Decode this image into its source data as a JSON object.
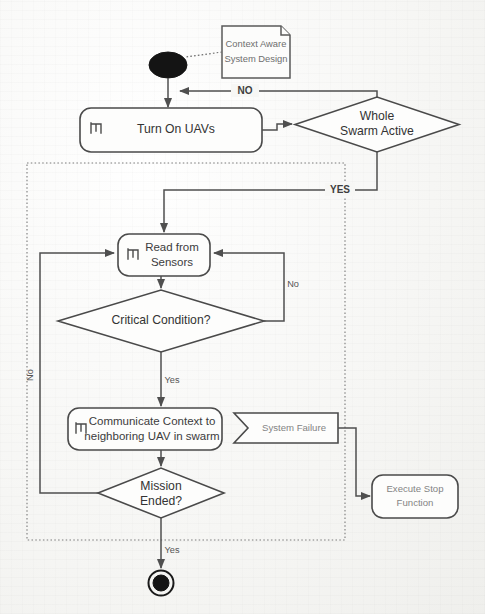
{
  "diagram": {
    "type": "uml-activity-diagram",
    "colors": {
      "stroke": "#4a4a4a",
      "fill": "#fdfdfc",
      "background": "#fbfbfa",
      "text": "#3c3c3c",
      "faint_text": "#848484"
    }
  },
  "note": {
    "line1": "Context Aware",
    "line2": "System Design"
  },
  "nodes": {
    "start": {
      "label": "",
      "shape": "initial-node"
    },
    "turn_on_uavs": {
      "label": "Turn On UAVs",
      "shape": "rounded-action",
      "icon": "rake-icon"
    },
    "whole_swarm_active": {
      "line1": "Whole",
      "line2": "Swarm Active",
      "shape": "decision-diamond"
    },
    "read_from_sensors": {
      "line1": "Read from",
      "line2": "Sensors",
      "shape": "rounded-action",
      "icon": "rake-icon"
    },
    "critical_condition": {
      "label": "Critical Condition?",
      "shape": "decision-diamond"
    },
    "communicate_context": {
      "line1": "Communicate Context to",
      "line2": "neighboring UAV in swarm",
      "shape": "rounded-action",
      "icon": "rake-icon"
    },
    "system_failure": {
      "label": "System Failure",
      "shape": "accept-signal"
    },
    "mission_ended": {
      "line1": "Mission",
      "line2": "Ended?",
      "shape": "decision-diamond"
    },
    "execute_stop_function": {
      "line1": "Execute Stop",
      "line2": "Function",
      "shape": "rounded-action"
    },
    "end": {
      "label": "",
      "shape": "final-node"
    }
  },
  "edge_labels": {
    "no_upper": "NO",
    "yes_upper": "YES",
    "no_sensor_loop": "No",
    "yes_critical": "Yes",
    "no_mission_loop": "No",
    "yes_mission": "Yes"
  }
}
